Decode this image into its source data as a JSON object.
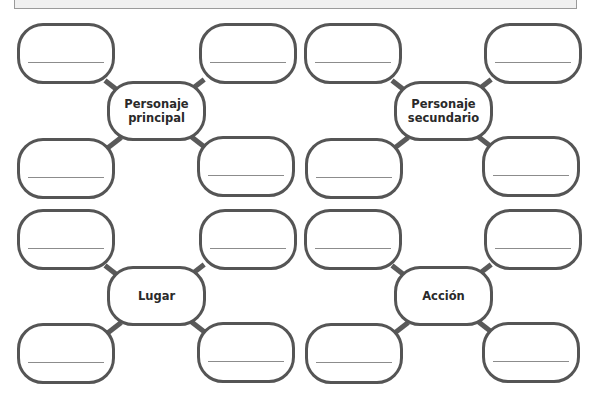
{
  "worksheet": {
    "clusters": [
      {
        "center_label": "Personaje\nprincipal",
        "blank_count": 4
      },
      {
        "center_label": "Personaje\nsecundario",
        "blank_count": 4
      },
      {
        "center_label": "Lugar",
        "blank_count": 4
      },
      {
        "center_label": "Acción",
        "blank_count": 4
      }
    ]
  },
  "colors": {
    "stroke": "#555555",
    "blank_line": "#8c8c8c",
    "banner_fill": "#f0f0f0",
    "banner_border": "#9a9a9a",
    "text": "#2a2a2a"
  }
}
